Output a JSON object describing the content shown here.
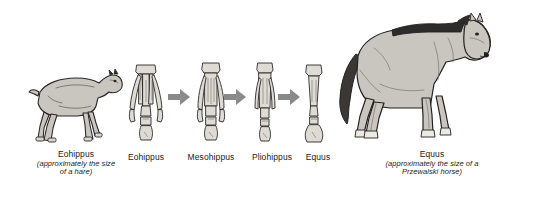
{
  "figure": {
    "title_text": "",
    "background_color": "#ffffff",
    "ink_color": "#1a1a1a",
    "arrow_color": "#8a8a8a",
    "body_fill": "#c9c6bf",
    "mane_color": "#2e2c2a",
    "bone_fill": "#dedbd4"
  },
  "left_animal": {
    "icon": "eohippus-animal-icon",
    "name": "Eohippus",
    "note_line1": "(approximately the size",
    "note_line2": "of a hare)"
  },
  "right_animal": {
    "icon": "equus-horse-icon",
    "name": "Equus",
    "note_line1": "(approximately the size of a",
    "note_line2": "Przewalski horse)"
  },
  "bone_sequence": {
    "arrow_icon": "right-arrow-icon",
    "items": [
      {
        "label": "Eohippus",
        "icon": "eohippus-foot-bone-icon",
        "toes": 4
      },
      {
        "label": "Mesohippus",
        "icon": "mesohippus-foot-bone-icon",
        "toes": 3
      },
      {
        "label": "Pliohippus",
        "icon": "pliohippus-foot-bone-icon",
        "toes": 3
      },
      {
        "label": "Equus",
        "icon": "equus-foot-bone-icon",
        "toes": 1
      }
    ],
    "arrow_count": 3
  }
}
